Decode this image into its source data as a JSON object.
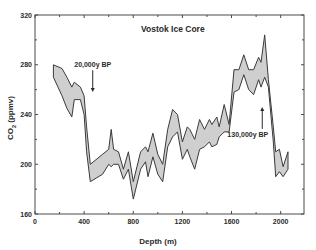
{
  "chart_data": {
    "type": "area",
    "title": "Vostok Ice Core",
    "xlabel": "Depth (m)",
    "ylabel": "CO2 (ppmv)",
    "ylabel_main": "CO",
    "ylabel_sub": "2",
    "ylabel_unit": " (ppmv)",
    "xlim": [
      0,
      2190
    ],
    "ylim": [
      160,
      320
    ],
    "xticks": [
      0,
      400,
      800,
      1200,
      1600,
      2000
    ],
    "xticks_minor": [
      200,
      600,
      1000,
      1400,
      1800
    ],
    "yticks": [
      160,
      200,
      240,
      280,
      320
    ],
    "yticks_minor": [
      180,
      220,
      260,
      300
    ],
    "grid": false,
    "series": [
      {
        "name": "CO2 range",
        "x": [
          150,
          220,
          260,
          300,
          320,
          370,
          400,
          420,
          450,
          550,
          600,
          620,
          640,
          680,
          720,
          760,
          800,
          860,
          900,
          920,
          960,
          1000,
          1040,
          1080,
          1120,
          1160,
          1200,
          1240,
          1260,
          1300,
          1340,
          1380,
          1420,
          1440,
          1480,
          1500,
          1540,
          1580,
          1620,
          1660,
          1700,
          1740,
          1780,
          1820,
          1840,
          1870,
          1900,
          1940,
          1960,
          1990,
          2020,
          2060
        ],
        "upper": [
          280,
          277,
          270,
          262,
          266,
          262,
          255,
          230,
          200,
          208,
          212,
          228,
          212,
          210,
          196,
          210,
          186,
          210,
          214,
          210,
          225,
          208,
          200,
          228,
          244,
          240,
          218,
          230,
          228,
          220,
          236,
          228,
          236,
          232,
          238,
          230,
          248,
          232,
          276,
          276,
          288,
          276,
          276,
          286,
          282,
          304,
          268,
          230,
          210,
          212,
          198,
          210
        ],
        "lower": [
          270,
          255,
          245,
          238,
          252,
          252,
          240,
          210,
          186,
          192,
          200,
          198,
          200,
          200,
          188,
          196,
          172,
          196,
          202,
          190,
          206,
          192,
          186,
          214,
          222,
          226,
          204,
          212,
          206,
          196,
          212,
          214,
          218,
          214,
          216,
          222,
          226,
          226,
          258,
          260,
          272,
          260,
          256,
          268,
          262,
          270,
          262,
          218,
          190,
          194,
          190,
          196
        ]
      }
    ],
    "annotations": [
      {
        "text": "20,000y BP",
        "x": 470,
        "y": 278,
        "arrow_to": [
          470,
          258
        ],
        "direction": "down"
      },
      {
        "text": "130,000y BP",
        "x": 1850,
        "y": 222,
        "arrow_to": [
          1850,
          246
        ],
        "direction": "up"
      }
    ],
    "legend": "none"
  }
}
